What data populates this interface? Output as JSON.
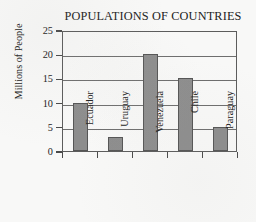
{
  "chart_data": {
    "type": "bar",
    "title": "POPULATIONS OF COUNTRIES",
    "xlabel": "",
    "ylabel": "Millions of People",
    "categories": [
      "Ecuador",
      "Uruguay",
      "Venezuela",
      "Chile",
      "Paraguay"
    ],
    "values": [
      10,
      3,
      20,
      15,
      5
    ],
    "ylim": [
      0,
      25
    ],
    "ytick_labels": [
      "0",
      "5",
      "10",
      "15",
      "20",
      "25"
    ],
    "ytick_values": [
      0,
      5,
      10,
      15,
      20,
      25
    ],
    "grid": true,
    "legend": false,
    "series": [
      {
        "name": "Population",
        "values": [
          10,
          3,
          20,
          15,
          5
        ]
      }
    ],
    "bar_color": "#8d8d8d",
    "bar_border_color": "#555555",
    "axis_color": "#5c5c5c",
    "background_color": "#f8f8f7"
  }
}
